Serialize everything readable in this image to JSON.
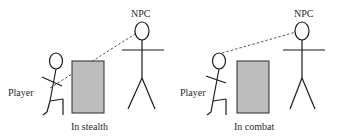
{
  "panels": [
    {
      "id": "stealth",
      "caption": "In stealth",
      "player_label": "Player",
      "npc_label": "NPC",
      "sight_line": "dashed line from NPC head to player's torso (blocked by obstacle)"
    },
    {
      "id": "combat",
      "caption": "In combat",
      "player_label": "Player",
      "npc_label": "NPC",
      "sight_line": "dashed line from NPC head to player's head (clear line of sight)"
    }
  ],
  "colors": {
    "stroke": "#1a1a1a",
    "obstacle_fill": "#bdbdbd",
    "obstacle_stroke": "#2a2a2a",
    "sight_line": "#555555"
  }
}
